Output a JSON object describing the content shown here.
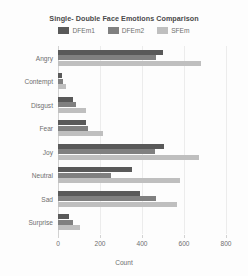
{
  "chart_data": {
    "type": "bar",
    "orientation": "horizontal",
    "title": "Single- Double Face Emotions Comparison",
    "xlabel": "Count",
    "ylabel": "Emotions",
    "categories": [
      "Angry",
      "Contempt",
      "Disgust",
      "Fear",
      "Joy",
      "Neutral",
      "Sad",
      "Surprise"
    ],
    "series": [
      {
        "name": "DFEm1",
        "color": "#595959",
        "values": [
          500,
          20,
          70,
          135,
          505,
          350,
          390,
          50
        ]
      },
      {
        "name": "DFEm2",
        "color": "#808080",
        "values": [
          465,
          25,
          85,
          145,
          460,
          250,
          465,
          70
        ]
      },
      {
        "name": "SFEm",
        "color": "#bfbfbf",
        "values": [
          680,
          40,
          135,
          215,
          670,
          580,
          565,
          105
        ]
      }
    ],
    "xticks": [
      0,
      200,
      400,
      600,
      800
    ],
    "xlim": [
      0,
      800
    ],
    "grid": true,
    "legend_position": "top"
  },
  "legend": {
    "entries": [
      {
        "label": "DFEm1",
        "color": "#595959"
      },
      {
        "label": "DFEm2",
        "color": "#808080"
      },
      {
        "label": "SFEm",
        "color": "#bfbfbf"
      }
    ]
  }
}
